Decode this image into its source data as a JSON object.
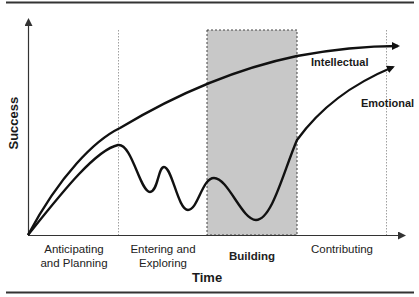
{
  "diagram": {
    "y_axis_label": "Success",
    "x_axis_label": "Time",
    "phases": [
      {
        "line1": "Anticipating",
        "line2": "and Planning",
        "emphasized": false
      },
      {
        "line1": "Entering and",
        "line2": "Exploring",
        "emphasized": false
      },
      {
        "line1": "Building",
        "line2": "",
        "emphasized": true
      },
      {
        "line1": "Contributing",
        "line2": "",
        "emphasized": false
      }
    ],
    "curves": [
      {
        "name": "Intellectual",
        "description": "steadily rising, flattening curve"
      },
      {
        "name": "Emotional",
        "description": "rises, then oscillates downward through Entering and Exploring and Building, then rises steeply in Contributing"
      }
    ],
    "highlighted_phase": "Building",
    "colors": {
      "line": "#111111",
      "shaded_region": "#c8c8c8",
      "divider": "#888888"
    }
  }
}
